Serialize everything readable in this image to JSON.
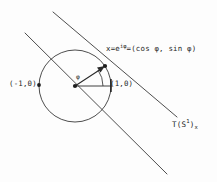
{
  "figure": {
    "background_color": "#fdfdfd",
    "ink_color": "#2a2a2a",
    "labels": {
      "point_x": {
        "prefix": "x=e",
        "exponent": "iφ",
        "suffix": "=(cos φ, sin φ)"
      },
      "left_point": "(-1,0)",
      "right_point": "(1,0)",
      "angle": "φ",
      "tangent_space": {
        "base": "T(S",
        "superscript": "1",
        "close": ")",
        "subscript": "x"
      }
    },
    "geometry": {
      "circle": {
        "cx": 75,
        "cy": 86,
        "r": 36
      },
      "center_dot": {
        "cx": 75,
        "cy": 86
      },
      "point_on_circle": {
        "cx": 105,
        "cy": 66
      },
      "point_left": {
        "cx": 39,
        "cy": 86
      },
      "point_right": {
        "cx": 111,
        "cy": 86
      },
      "radius_horizontal": {
        "x1": 75,
        "y1": 86,
        "x2": 111,
        "y2": 86
      },
      "radius_vector": {
        "x1": 75,
        "y1": 86,
        "x2": 105,
        "y2": 66
      },
      "angle_arc_radius": 28,
      "tangent_line": {
        "x1": 53,
        "y1": 12,
        "x2": 177,
        "y2": 117
      },
      "parallel_line": {
        "x1": 25,
        "y1": 33,
        "x2": 167,
        "y2": 174
      }
    }
  }
}
